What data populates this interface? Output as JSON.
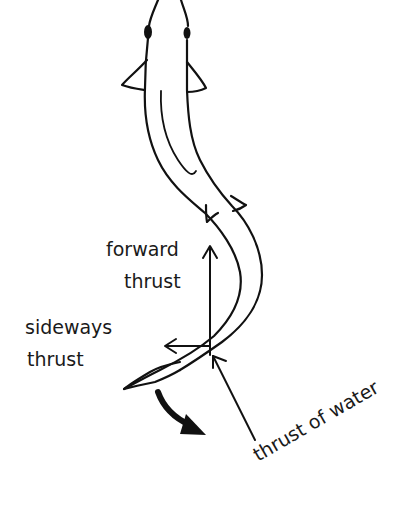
{
  "diagram": {
    "labels": {
      "forward_line1": "forward",
      "forward_line2": "thrust",
      "sideways_line1": "sideways",
      "sideways_line2": "thrust",
      "water": "thrust of water"
    },
    "colors": {
      "ink": "#111111",
      "background": "#ffffff"
    },
    "arrows": [
      {
        "name": "forward thrust",
        "direction": "up"
      },
      {
        "name": "sideways thrust",
        "direction": "left"
      },
      {
        "name": "thrust of water",
        "direction": "up-left"
      },
      {
        "name": "tail motion",
        "direction": "curved down-right"
      }
    ]
  }
}
